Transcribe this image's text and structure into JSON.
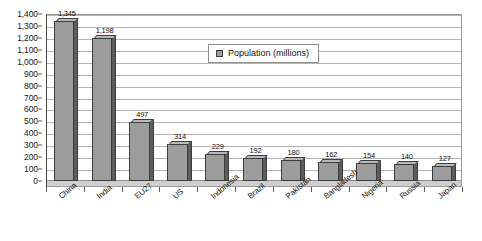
{
  "chart_data": {
    "type": "bar",
    "title": "",
    "subtitle": "",
    "xlabel": "",
    "ylabel": "",
    "categories": [
      "China",
      "India",
      "EU27",
      "US",
      "Indonesia",
      "Brazil",
      "Pakistan",
      "Bangladesh",
      "Nigeria",
      "Russia",
      "Japan"
    ],
    "values": [
      1345,
      1198,
      497,
      314,
      229,
      192,
      180,
      162,
      154,
      140,
      127
    ],
    "data_labels": [
      "1,345",
      "1,198",
      "497",
      "314",
      "229",
      "192",
      "180",
      "162",
      "154",
      "140",
      "127"
    ],
    "series": [
      {
        "name": "Population (millions)",
        "values": [
          1345,
          1198,
          497,
          314,
          229,
          192,
          180,
          162,
          154,
          140,
          127
        ]
      }
    ],
    "ylim": [
      0,
      1400
    ],
    "ytick_step": 100,
    "ytick_labels": [
      "1,400",
      "1,300",
      "1,200",
      "1,100",
      "1,000",
      "900",
      "800",
      "700",
      "600",
      "500",
      "400",
      "300",
      "200",
      "100",
      "0"
    ],
    "ytick_values": [
      1400,
      1300,
      1200,
      1100,
      1000,
      900,
      800,
      700,
      600,
      500,
      400,
      300,
      200,
      100,
      0
    ],
    "grid": true,
    "grid_axis": "y",
    "legend": {
      "position": "inside-top-center",
      "entries": [
        {
          "label": "Population (millions)",
          "color": "#9d9d9d"
        }
      ]
    },
    "style": {
      "bar_fill": "#9d9d9d",
      "bar_edge": "#3c3c3c",
      "bar_side_face": "#5c5c5c",
      "bar_top_face": "#b9b9b9",
      "gridline_color": "#b4b4b4",
      "plot_border": "#9a9a9a",
      "axis_color": "#4a4a4a",
      "background": "#ffffff",
      "effect": "3d"
    },
    "xtick_label_rotation": -40
  }
}
